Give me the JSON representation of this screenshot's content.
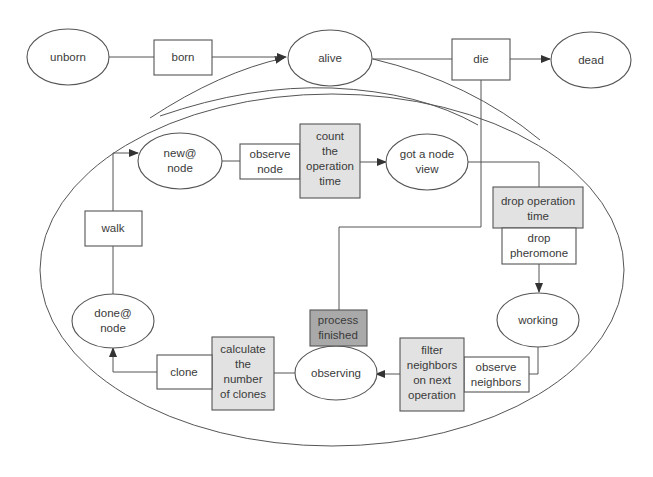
{
  "diagram": {
    "type": "state-transition flowchart",
    "outer_states": {
      "unborn": "unborn",
      "born": "born",
      "alive": "alive",
      "die": "die",
      "dead": "dead"
    },
    "inner_states": {
      "new_at_node": [
        "new@",
        "node"
      ],
      "observe_node": [
        "observe",
        "node"
      ],
      "count_time": [
        "count",
        "the",
        "operation",
        "time"
      ],
      "got_node_view": [
        "got a node",
        "view"
      ],
      "drop_op_time": [
        "drop operation",
        "time"
      ],
      "drop_pheromone": [
        "drop",
        "pheromone"
      ],
      "working": "working",
      "observe_neighbors": [
        "observe",
        "neighbors"
      ],
      "filter_neighbors": [
        "filter",
        "neighbors",
        "on next",
        "operation"
      ],
      "observing": "observing",
      "process_finished": [
        "process",
        "finished"
      ],
      "calc_clones": [
        "calculate",
        "the",
        "number",
        "of clones"
      ],
      "clone": "clone",
      "done_at_node": [
        "done@",
        "node"
      ],
      "walk": "walk"
    },
    "colors": {
      "stroke": "#555555",
      "shaded_fill": "#e2e2e2",
      "dark_fill": "#a9a9a9",
      "background": "#ffffff"
    }
  }
}
